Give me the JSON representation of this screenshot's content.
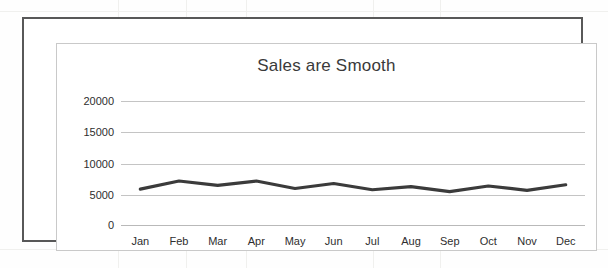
{
  "figure": {
    "title": "Sales are Smooth"
  },
  "chart_data": {
    "type": "line",
    "title": "Sales are Smooth",
    "xlabel": "",
    "ylabel": "",
    "categories": [
      "Jan",
      "Feb",
      "Mar",
      "Apr",
      "May",
      "Jun",
      "Jul",
      "Aug",
      "Sep",
      "Oct",
      "Nov",
      "Dec"
    ],
    "values": [
      5900,
      7200,
      6500,
      7200,
      6000,
      6800,
      5800,
      6300,
      5500,
      6400,
      5700,
      6600
    ],
    "series": [
      {
        "name": "Sales",
        "values": [
          5900,
          7200,
          6500,
          7200,
          6000,
          6800,
          5800,
          6300,
          5500,
          6400,
          5700,
          6600
        ]
      }
    ],
    "ylim": [
      0,
      20000
    ],
    "yticks": [
      0,
      5000,
      10000,
      15000,
      20000
    ],
    "ytick_labels": [
      "0",
      "5000",
      "10000",
      "15000",
      "20000"
    ],
    "grid": true,
    "legend": false,
    "line_color": "#3b3b3b",
    "gridline_color": "#c4c4c4",
    "background_color": "#ffffff"
  }
}
